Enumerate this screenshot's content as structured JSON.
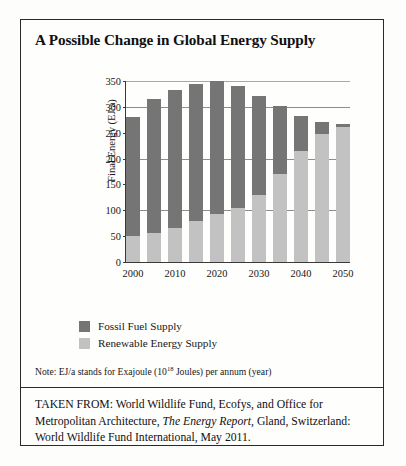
{
  "figure": {
    "title": "A Possible Change in Global Energy Supply",
    "note_prefix": "Note: EJ/a stands for Exajoule (10",
    "note_exponent": "18",
    "note_suffix": " Joules) per annum (year)",
    "source_line1": "TAKEN FROM: World Wildlife Fund, Ecofys, and Office for",
    "source_line2_a": "Metropolitan Architecture, ",
    "source_line2_italic": "The Energy Report",
    "source_line2_b": ", Gland, Switzerland:",
    "source_line3": "World Wildlife Fund International, May 2011."
  },
  "legend": {
    "items": [
      {
        "label": "Fossil Fuel Supply",
        "color": "#757575"
      },
      {
        "label": "Renewable Energy Supply",
        "color": "#c2c2c2"
      }
    ]
  },
  "chart_data": {
    "type": "bar",
    "subtype": "stacked",
    "title": "A Possible Change in Global Energy Supply",
    "xlabel": "",
    "ylabel": "Final Energy (EJ/a)",
    "ylim": [
      0,
      350
    ],
    "yticks": [
      0,
      50,
      100,
      150,
      200,
      250,
      300,
      350
    ],
    "ytick_labels": [
      "0",
      "50",
      "100",
      "150",
      "200",
      "250",
      "300",
      "350"
    ],
    "grid": true,
    "legend_position": "below-plot-left",
    "categories": [
      "2000",
      "2005",
      "2010",
      "2015",
      "2020",
      "2025",
      "2030",
      "2035",
      "2040",
      "2045",
      "2050"
    ],
    "xtick_labels": [
      "2000",
      "2010",
      "2020",
      "2030",
      "2040",
      "2050"
    ],
    "xtick_categories": [
      "2000",
      "2010",
      "2020",
      "2030",
      "2040",
      "2050"
    ],
    "series": [
      {
        "name": "Renewable Energy Supply",
        "color": "#c2c2c2",
        "values": [
          50,
          57,
          65,
          80,
          93,
          105,
          130,
          170,
          215,
          248,
          262
        ]
      },
      {
        "name": "Fossil Fuel Supply",
        "color": "#757575",
        "values": [
          230,
          258,
          267,
          265,
          257,
          236,
          192,
          132,
          68,
          22,
          5
        ]
      }
    ],
    "totals": [
      280,
      315,
      332,
      345,
      350,
      341,
      322,
      302,
      283,
      270,
      267
    ]
  }
}
